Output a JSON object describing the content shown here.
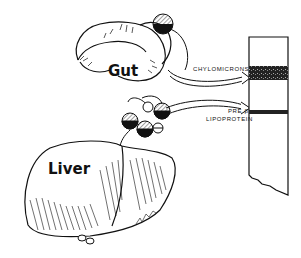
{
  "figure": {
    "organs": {
      "gut": {
        "label": "Gut"
      },
      "liver": {
        "label": "Liver"
      }
    },
    "lipoproteins": [
      {
        "name": "chylomicrons",
        "label": "CHYLOMICRONS",
        "source": "Gut"
      },
      {
        "name": "pre-beta-lipoprotein",
        "label_line1": "PRE β",
        "label_line2": "LIPOPROTEIN",
        "source": "Liver"
      }
    ],
    "electrophoresis_strip": {
      "bands": [
        "chylomicrons",
        "pre-beta-lipoprotein"
      ]
    },
    "colors": {
      "ink": "#111111",
      "background": "#ffffff"
    }
  }
}
